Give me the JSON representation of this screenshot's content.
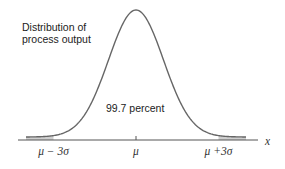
{
  "chart_data": {
    "type": "area",
    "title": "",
    "distribution": "normal",
    "mean": 0,
    "sd": 1,
    "x_range": [
      -3.4,
      3.6
    ],
    "shaded_tails_beyond_sd": 3,
    "annotations": {
      "curve_label_line1": "Distribution of",
      "curve_label_line2": "process output",
      "center_label": "99.7 percent"
    },
    "tick_labels": [
      {
        "value": -3,
        "label": "μ − 3σ"
      },
      {
        "value": 0,
        "label": "μ"
      },
      {
        "value": 3,
        "label": "μ +3σ"
      }
    ],
    "xlabel": "x",
    "colors": {
      "curve": "#666666",
      "tail_fill": "#cfcfcf",
      "axis": "#555555"
    }
  }
}
